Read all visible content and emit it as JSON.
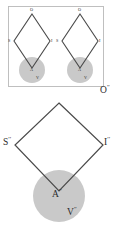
{
  "figure": {
    "width": 119,
    "height": 233,
    "background": "#ffffff",
    "line_color": "#4a4a4a",
    "box_border_color": "#b9b9b9",
    "circle_fill": "#c9c9c9",
    "text_color": "#2b2b2b"
  },
  "panel_top": {
    "name": "boxed-pair-panel",
    "border": true,
    "diamond_left": {
      "apex_top_label": "O",
      "left_label": "S",
      "right_label": "I",
      "center_label": "A",
      "sub_label": "V"
    },
    "diamond_right": {
      "apex_top_label": "O",
      "left_label": "S",
      "right_label": "I",
      "center_label": "A",
      "sub_label": "V"
    }
  },
  "panel_bottom": {
    "name": "large-diamond-panel",
    "apex_top_label": "O",
    "apex_top_sup": "′′",
    "left_label": "S",
    "left_sup": "′′",
    "right_label": "I",
    "right_sup": "′′",
    "center_label": "A",
    "center_sup": "′′",
    "sub_label": "V",
    "sub_sup": "′′"
  }
}
